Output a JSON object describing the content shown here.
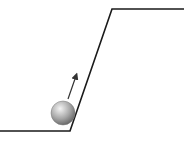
{
  "diagram": {
    "colors": {
      "line": "#1a1a1a",
      "ball_light": "#f2f2f2",
      "ball_dark": "#6e6e6e",
      "arrow": "#333333",
      "background": "#ffffff"
    },
    "elements": [
      "ground-line",
      "ramp-incline",
      "upper-plateau",
      "ball",
      "velocity-arrow"
    ]
  }
}
